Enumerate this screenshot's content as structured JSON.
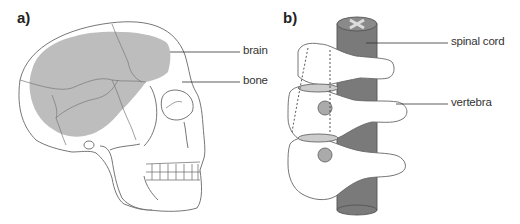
{
  "panels": [
    {
      "id": "a",
      "label": "a)",
      "subject": "skull",
      "annotations": [
        {
          "text": "brain"
        },
        {
          "text": "bone"
        }
      ]
    },
    {
      "id": "b",
      "label": "b)",
      "subject": "spine",
      "annotations": [
        {
          "text": "spinal cord"
        },
        {
          "text": "vertebra"
        }
      ]
    }
  ],
  "colors": {
    "brain_fill": "#bdbdbd",
    "spinal_cord_fill": "#7a7a7a",
    "outline": "#555555",
    "bone_fill": "#ffffff"
  }
}
